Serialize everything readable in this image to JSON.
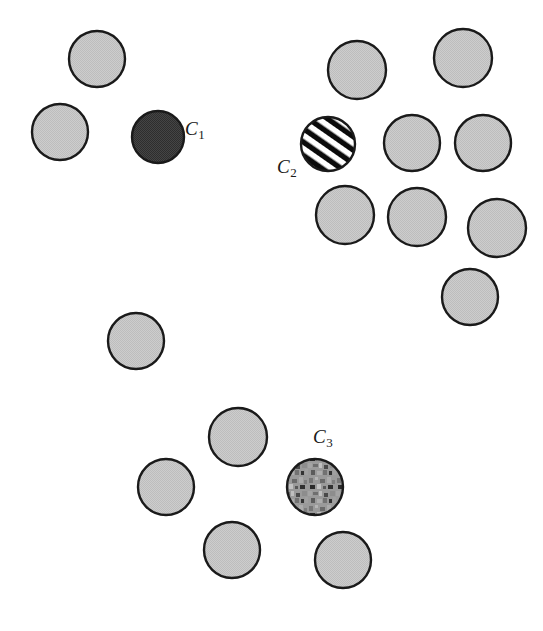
{
  "figure": {
    "width": 543,
    "height": 631,
    "background_color": "#ffffff",
    "plain_fill_color": "#c9c9c9",
    "outline_color": "#1a1a1a",
    "outline_width": 2.4
  },
  "chart_data": {
    "type": "scatter",
    "title": "",
    "xlabel": "",
    "ylabel": "",
    "xlim": [
      0,
      543
    ],
    "ylim": [
      0,
      631
    ],
    "grid": false,
    "legend": "none",
    "marker": "circle",
    "series": [
      {
        "name": "plain-circles",
        "fill": "#c9c9c9",
        "texture": "solid-gray",
        "points": [
          {
            "id": "p1",
            "x": 97,
            "y": 59,
            "r": 28
          },
          {
            "id": "p2",
            "x": 60,
            "y": 132,
            "r": 28
          },
          {
            "id": "p3",
            "x": 357,
            "y": 70,
            "r": 29
          },
          {
            "id": "p4",
            "x": 463,
            "y": 58,
            "r": 29
          },
          {
            "id": "p5",
            "x": 412,
            "y": 143,
            "r": 28
          },
          {
            "id": "p6",
            "x": 483,
            "y": 143,
            "r": 28
          },
          {
            "id": "p7",
            "x": 345,
            "y": 215,
            "r": 29
          },
          {
            "id": "p8",
            "x": 417,
            "y": 217,
            "r": 29
          },
          {
            "id": "p9",
            "x": 497,
            "y": 228,
            "r": 29
          },
          {
            "id": "p10",
            "x": 470,
            "y": 297,
            "r": 28
          },
          {
            "id": "p11",
            "x": 136,
            "y": 341,
            "r": 28
          },
          {
            "id": "p12",
            "x": 238,
            "y": 437,
            "r": 29
          },
          {
            "id": "p13",
            "x": 166,
            "y": 487,
            "r": 28
          },
          {
            "id": "p14",
            "x": 232,
            "y": 550,
            "r": 28
          },
          {
            "id": "p15",
            "x": 343,
            "y": 560,
            "r": 28
          }
        ]
      },
      {
        "name": "labelled-circles",
        "points": [
          {
            "id": "c1",
            "label": "C",
            "subscript": "1",
            "x": 158,
            "y": 137,
            "r": 26,
            "texture": "dark-fill",
            "fill": "#3c3c3c",
            "label_x": 185,
            "label_y": 119
          },
          {
            "id": "c2",
            "label": "C",
            "subscript": "2",
            "x": 328,
            "y": 144,
            "r": 27,
            "texture": "diagonal-stripes",
            "fill": "#000000",
            "label_x": 277,
            "label_y": 157
          },
          {
            "id": "c3",
            "label": "C",
            "subscript": "3",
            "x": 315,
            "y": 487,
            "r": 28,
            "texture": "noise-mottle",
            "fill": "#8f8f8f",
            "label_x": 313,
            "label_y": 427
          }
        ]
      }
    ]
  }
}
